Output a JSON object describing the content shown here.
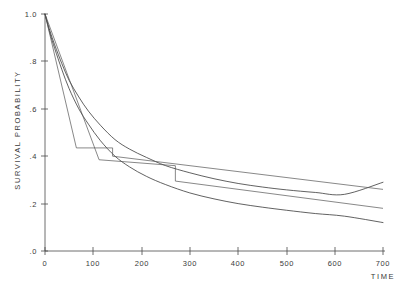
{
  "chart_data": {
    "type": "line",
    "title": "",
    "xlabel": "TIME",
    "ylabel": "SURVIVAL PROBABILITY",
    "xlim": [
      0,
      700
    ],
    "ylim": [
      0.0,
      1.0
    ],
    "grid": false,
    "legend": "none",
    "xticks": [
      0,
      100,
      200,
      300,
      400,
      500,
      600,
      700
    ],
    "xtick_labels": [
      "0",
      "100",
      "200",
      "300",
      "400",
      "500",
      "600",
      "700"
    ],
    "yticks": [
      0.0,
      0.2,
      0.4,
      0.6,
      0.8,
      1.0
    ],
    "ytick_labels": [
      ".0",
      ".2",
      ".4",
      ".6",
      ".8",
      "1.0"
    ],
    "series": [
      {
        "name": "fitted-curve-upper",
        "style": "smooth",
        "x": [
          0,
          10,
          20,
          35,
          50,
          70,
          90,
          115,
          145,
          175,
          210,
          250,
          300,
          350,
          400,
          450,
          500,
          560,
          620,
          700
        ],
        "y": [
          1.0,
          0.93,
          0.87,
          0.79,
          0.72,
          0.65,
          0.59,
          0.53,
          0.47,
          0.43,
          0.395,
          0.36,
          0.33,
          0.305,
          0.285,
          0.27,
          0.258,
          0.247,
          0.239,
          0.29
        ]
      },
      {
        "name": "fitted-curve-lower",
        "style": "smooth",
        "x": [
          0,
          10,
          20,
          35,
          50,
          70,
          90,
          115,
          145,
          175,
          210,
          250,
          300,
          350,
          400,
          450,
          500,
          560,
          620,
          700
        ],
        "y": [
          1.0,
          0.92,
          0.855,
          0.765,
          0.685,
          0.6,
          0.535,
          0.465,
          0.4,
          0.355,
          0.315,
          0.28,
          0.245,
          0.22,
          0.2,
          0.185,
          0.172,
          0.158,
          0.147,
          0.12
        ]
      },
      {
        "name": "kaplan-meier-step-a",
        "style": "step",
        "x": [
          0,
          65,
          65,
          140,
          140,
          700
        ],
        "y": [
          1.0,
          0.435,
          0.435,
          0.435,
          0.4,
          0.26
        ]
      },
      {
        "name": "kaplan-meier-step-b",
        "style": "step",
        "x": [
          0,
          112,
          112,
          270,
          270,
          700
        ],
        "y": [
          1.0,
          0.385,
          0.385,
          0.36,
          0.295,
          0.18
        ]
      }
    ]
  },
  "axes": {
    "x_axis_name": "time-axis",
    "y_axis_name": "survival-probability-axis"
  }
}
